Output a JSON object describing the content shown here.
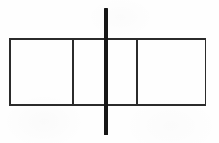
{
  "figure": {
    "kind": "line-diagram",
    "background_color": "#fefefe",
    "stroke_color": "#2b2b2b",
    "thick_stroke_color": "#161616",
    "canvas": {
      "width": 219,
      "height": 143
    }
  },
  "rectangle": {
    "label": "outer-rectangle",
    "x": 9,
    "y": 38,
    "width": 197,
    "height": 66,
    "stroke_width": 1.5,
    "edges": {
      "top_label": "top-edge",
      "bottom_label": "bottom-edge",
      "left_label": "left-edge",
      "right_label": "right-edge"
    }
  },
  "dividers": [
    {
      "label": "divider-1",
      "x": 72,
      "y": 38,
      "height": 66,
      "stroke_width": 1.5
    },
    {
      "label": "divider-2",
      "x": 136,
      "y": 38,
      "height": 66,
      "stroke_width": 1.5
    }
  ],
  "cells": [
    {
      "label": "cell-left",
      "x": 9,
      "width": 63
    },
    {
      "label": "cell-middle",
      "x": 72,
      "width": 64
    },
    {
      "label": "cell-right",
      "x": 136,
      "width": 70
    }
  ],
  "vertical_bar": {
    "label": "thick-vertical-bar",
    "x": 104,
    "y": 8,
    "width": 4,
    "height": 127,
    "color": "#161616",
    "extends_above": true,
    "extends_below": true
  }
}
